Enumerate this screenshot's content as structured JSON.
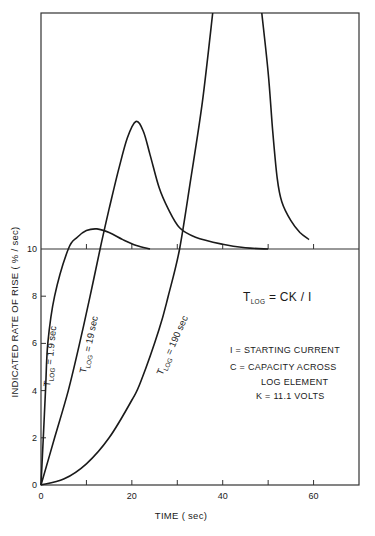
{
  "chart_data": {
    "type": "line",
    "title": "",
    "xlabel": "TIME ( sec)",
    "ylabel": "INDICATED RATE OF RISE ( % / sec)",
    "xlim": [
      0,
      70
    ],
    "ylim_lower_panel": [
      0,
      10
    ],
    "upper_panel_note": "Upper panel above 10 %/sec has no labeled scale; values given as fraction of upper panel height (0 = the 10 line, 1 = top of frame)",
    "x_ticks": [
      0,
      10,
      20,
      30,
      40,
      50,
      60,
      70
    ],
    "x_tick_labels": [
      "0",
      "20",
      "40",
      "60"
    ],
    "y_ticks": [
      0,
      2,
      4,
      6,
      8,
      10
    ],
    "y_tick_labels": [
      "0",
      "2",
      "4",
      "6",
      "8",
      "10"
    ],
    "grid": false,
    "legend": "none (curves labeled inline)",
    "series": [
      {
        "name": "T_LOG = 1.9 sec",
        "lower": [
          [
            0,
            0
          ],
          [
            0.5,
            2
          ],
          [
            1,
            4
          ],
          [
            1.5,
            6
          ],
          [
            3,
            8
          ],
          [
            6,
            10
          ]
        ],
        "upper": [
          [
            6,
            0
          ],
          [
            8,
            0.05
          ],
          [
            10,
            0.078
          ],
          [
            12.3,
            0.085
          ],
          [
            15,
            0.07
          ],
          [
            18,
            0.04
          ],
          [
            21,
            0.015
          ],
          [
            24,
            0
          ]
        ]
      },
      {
        "name": "T_LOG = 19 sec",
        "lower": [
          [
            0,
            0
          ],
          [
            3,
            2
          ],
          [
            6,
            4
          ],
          [
            8.5,
            6
          ],
          [
            10.8,
            8
          ],
          [
            13,
            10
          ]
        ],
        "upper": [
          [
            13,
            0
          ],
          [
            15,
            0.17
          ],
          [
            17,
            0.33
          ],
          [
            19,
            0.47
          ],
          [
            20.9,
            0.54
          ],
          [
            22.5,
            0.5
          ],
          [
            24,
            0.4
          ],
          [
            26,
            0.26
          ],
          [
            28,
            0.17
          ],
          [
            30.5,
            0.09
          ],
          [
            34,
            0.05
          ],
          [
            40,
            0.02
          ],
          [
            45,
            0.005
          ],
          [
            50,
            0
          ]
        ]
      },
      {
        "name": "T_LOG = 190 sec",
        "lower": [
          [
            0,
            0
          ],
          [
            5,
            0.25
          ],
          [
            10,
            0.9
          ],
          [
            15,
            2.0
          ],
          [
            20,
            3.6
          ],
          [
            22,
            4.4
          ],
          [
            26,
            6.6
          ],
          [
            28,
            8
          ],
          [
            30.5,
            10
          ]
        ],
        "upper": [
          [
            30.5,
            0
          ],
          [
            33,
            0.3
          ],
          [
            35.5,
            0.62
          ],
          [
            37.8,
            1.0
          ]
        ],
        "upper_descending": [
          [
            48.6,
            1.0
          ],
          [
            50,
            0.75
          ],
          [
            51,
            0.5
          ],
          [
            52,
            0.3
          ],
          [
            53,
            0.2
          ],
          [
            55,
            0.12
          ],
          [
            57,
            0.07
          ],
          [
            59,
            0.04
          ]
        ]
      }
    ],
    "annotations": [
      "T_LOG = CK / I",
      "I = STARTING CURRENT",
      "C = CAPACITY ACROSS LOG ELEMENT",
      "K = 11.1 VOLTS"
    ]
  },
  "labels": {
    "xlabel": "TIME ( sec)",
    "ylabel": "INDICATED RATE OF RISE ( % / sec)",
    "curve1": {
      "t": "T",
      "sub": "LOG",
      "rest": " = 1.9 sec"
    },
    "curve2": {
      "t": "T",
      "sub": "LOG",
      "rest": " = 19 sec"
    },
    "curve3": {
      "t": "T",
      "sub": "LOG",
      "rest": " = 190 sec"
    },
    "formula": {
      "t": "T",
      "sub": "LOG",
      "rest": " = CK / I"
    },
    "def_i": "I = STARTING CURRENT",
    "def_c1": "C = CAPACITY ACROSS",
    "def_c2": "LOG ELEMENT",
    "def_k": "K = 11.1  VOLTS"
  },
  "colors": {
    "ink": "#1a1a1a",
    "frame": "#333333",
    "background": "#ffffff"
  }
}
